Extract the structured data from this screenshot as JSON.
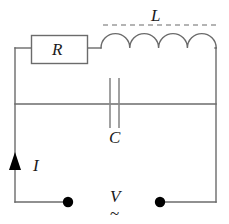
{
  "figure": {
    "kind": "electrical-circuit-schematic",
    "background_color": "#ffffff",
    "wire_color": "#6b6b6b",
    "label_color": "#1a1a1a",
    "terminal_color": "#000000"
  },
  "labels": {
    "resistor": "R",
    "inductor": "L",
    "capacitor": "C",
    "current": "I",
    "voltage": "V",
    "ac_source": "~"
  },
  "components": {
    "resistor": {
      "name": "R",
      "type": "resistor",
      "shape": "rectangle",
      "x": 31,
      "y": 35,
      "width": 57,
      "height": 29
    },
    "inductor": {
      "name": "L",
      "type": "inductor",
      "shape": "coil-arcs",
      "arc_count": 4,
      "x_start": 100,
      "x_end": 215,
      "baseline_y": 48,
      "arc_height": 15
    },
    "capacitor": {
      "name": "C",
      "type": "capacitor",
      "shape": "parallel-plates",
      "plate_left_x": 110,
      "plate_right_x": 119,
      "plate_top_y": 78,
      "plate_bottom_y": 128
    },
    "current_arrow": {
      "name": "I",
      "type": "current-direction-arrow",
      "direction": "up",
      "x": 15,
      "y": 166
    },
    "terminals": [
      {
        "name": "left-terminal",
        "x": 68,
        "y": 202,
        "radius": 5
      },
      {
        "name": "right-terminal",
        "x": 160,
        "y": 202,
        "radius": 5
      }
    ],
    "inductor_brace": {
      "type": "dashed-line",
      "x_start": 103,
      "x_end": 216,
      "y": 25
    }
  },
  "wires": {
    "top_left_segment": {
      "x1": 15,
      "y1": 48,
      "x2": 31,
      "y2": 48
    },
    "resistor_to_coil": {
      "x1": 88,
      "y1": 48,
      "x2": 100,
      "y2": 48
    },
    "coil_to_right_corner": {
      "x1": 215,
      "y1": 48,
      "x2": 216,
      "y2": 48
    },
    "left_vertical": {
      "x1": 15,
      "y1": 48,
      "x2": 15,
      "y2": 202
    },
    "right_vertical": {
      "x1": 216,
      "y1": 48,
      "x2": 216,
      "y2": 202
    },
    "middle_horizontal": {
      "x1": 15,
      "y1": 104,
      "x2": 216,
      "y2": 104
    },
    "bottom_left": {
      "x1": 15,
      "y1": 202,
      "x2": 68,
      "y2": 202
    },
    "bottom_right": {
      "x1": 160,
      "y1": 202,
      "x2": 216,
      "y2": 202
    }
  }
}
